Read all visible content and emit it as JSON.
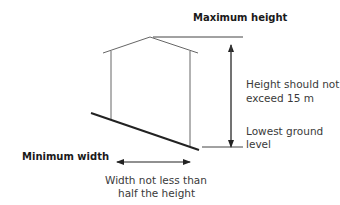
{
  "labels": {
    "max_height": "Maximum height",
    "height_note_line1": "Height should not",
    "height_note_line2": "exceed 15 m",
    "ground_line1": "Lowest ground",
    "ground_line2": "level",
    "min_width": "Minimum width",
    "width_note_line1": "Width not less than",
    "width_note_line2": "half the height"
  },
  "colors": {
    "line": "#555555",
    "ground": "#222222",
    "text": "#3a3a3a"
  }
}
